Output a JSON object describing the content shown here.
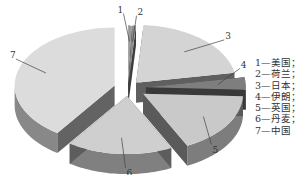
{
  "chart_data": {
    "type": "pie",
    "style": "3d-exploded",
    "title": "",
    "slices": [
      {
        "id": "1",
        "name": "美国",
        "value": 0.6,
        "color": "#9a9a9a"
      },
      {
        "id": "2",
        "name": "荷兰",
        "value": 0.6,
        "color": "#8a8a8a"
      },
      {
        "id": "3",
        "name": "日本",
        "value": 21,
        "color": "#d4d4d4"
      },
      {
        "id": "4",
        "name": "伊朗",
        "value": 3.5,
        "color": "#7e7e7e"
      },
      {
        "id": "5",
        "name": "英国",
        "value": 17,
        "color": "#c9c9c9"
      },
      {
        "id": "6",
        "name": "丹麦",
        "value": 17,
        "color": "#cfcfcf"
      },
      {
        "id": "7",
        "name": "中国",
        "value": 40.3,
        "color": "#dcdcdc"
      }
    ],
    "legend": {
      "placement": "right",
      "entries": [
        "1—美国；",
        "2—荷兰；",
        "3—日本；",
        "4—伊朗；",
        "5—英国；",
        "6—丹麦；",
        "7—中国"
      ]
    }
  }
}
